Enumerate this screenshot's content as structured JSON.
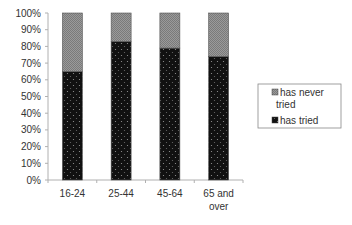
{
  "chart_data": {
    "type": "bar",
    "stacked": true,
    "title": "",
    "xlabel": "",
    "ylabel": "",
    "ylim": [
      0,
      100
    ],
    "y_ticks": [
      "0%",
      "10%",
      "20%",
      "30%",
      "40%",
      "50%",
      "60%",
      "70%",
      "80%",
      "90%",
      "100%"
    ],
    "categories": [
      [
        "16-24"
      ],
      [
        "25-44"
      ],
      [
        "45-64"
      ],
      [
        "65 and",
        "over"
      ]
    ],
    "series": [
      {
        "name": "has tried",
        "values": [
          65,
          83,
          79,
          74
        ],
        "color": "#111111",
        "pattern": "dotted"
      },
      {
        "name": "has never tried",
        "values": [
          35,
          17,
          21,
          26
        ],
        "color": "#8c8c8c",
        "pattern": "checkered"
      }
    ],
    "legend": {
      "placement": "right",
      "entries": [
        {
          "label_lines": [
            "has never",
            "tried"
          ],
          "series": "has never tried"
        },
        {
          "label_lines": [
            "has tried"
          ],
          "series": "has tried"
        }
      ]
    },
    "grid": false
  }
}
